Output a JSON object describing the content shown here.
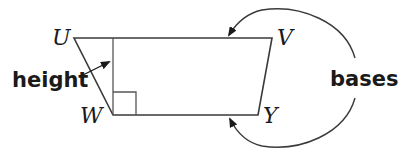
{
  "diagram": {
    "type": "trapezoid",
    "vertices": [
      {
        "label": "U",
        "x": 74,
        "y": 38
      },
      {
        "label": "V",
        "x": 272,
        "y": 38
      },
      {
        "label": "Y",
        "x": 258,
        "y": 115
      },
      {
        "label": "W",
        "x": 113,
        "y": 115
      }
    ],
    "labels": {
      "U": "U",
      "V": "V",
      "W": "W",
      "Y": "Y",
      "height": "height",
      "bases": "bases"
    },
    "height_segment": {
      "x": 113,
      "y1": 38,
      "y2": 115
    },
    "right_angle_marker": {
      "x": 113,
      "y": 92,
      "size": 23
    },
    "colors": {
      "stroke": "#3a3a3a",
      "text": "#1a1a1a",
      "background": "#ffffff"
    }
  }
}
